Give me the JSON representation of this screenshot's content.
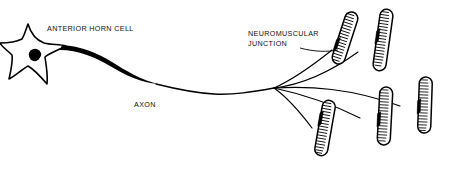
{
  "figure": {
    "background_color": "#ffffff",
    "ink_color": "#000000",
    "width": 449,
    "height": 169
  },
  "labels": {
    "cell_body": "ANTERIOR HORN CELL",
    "axon": "AXON",
    "junction_line1": "NEUROMUSCULAR",
    "junction_line2": "JUNCTION"
  },
  "structures": {
    "cell_body_name": "anterior-horn-cell-soma",
    "nucleus_name": "cell-nucleus",
    "axon_name": "axon-fiber",
    "branch_count": 5,
    "muscle_fiber_count": 5
  },
  "muscle_fibers": [
    {
      "id": "muscle-fiber-1",
      "cx": 345,
      "cy": 38,
      "length": 54,
      "width": 13,
      "angle": 18,
      "striations": 17
    },
    {
      "id": "muscle-fiber-2",
      "cx": 383,
      "cy": 40,
      "length": 62,
      "width": 13,
      "angle": 8,
      "striations": 19
    },
    {
      "id": "muscle-fiber-3",
      "cx": 425,
      "cy": 105,
      "length": 56,
      "width": 13,
      "angle": 2,
      "striations": 18
    },
    {
      "id": "muscle-fiber-4",
      "cx": 385,
      "cy": 116,
      "length": 58,
      "width": 13,
      "angle": 3,
      "striations": 18
    },
    {
      "id": "muscle-fiber-5",
      "cx": 325,
      "cy": 128,
      "length": 56,
      "width": 13,
      "angle": 10,
      "striations": 18
    }
  ],
  "branch_origin": {
    "x": 274,
    "y": 88
  }
}
